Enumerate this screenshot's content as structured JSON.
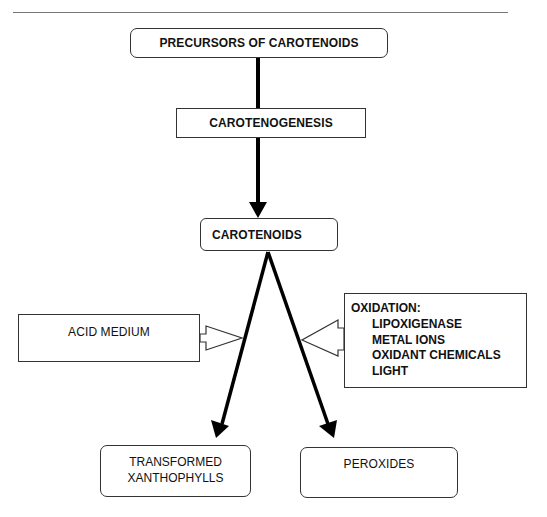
{
  "diagram": {
    "nodes": {
      "precursors": "PRECURSORS OF CAROTENOIDS",
      "carotenogenesis": "CAROTENOGENESIS",
      "carotenoids": "CAROTENOIDS",
      "acid_medium": "ACID MEDIUM",
      "oxidation": {
        "heading": "OXIDATION:",
        "items": [
          "LIPOXIGENASE",
          "METAL IONS",
          "OXIDANT CHEMICALS",
          "LIGHT"
        ]
      },
      "transformed_xanthophylls": {
        "line1": "TRANSFORMED",
        "line2": "XANTHOPHYLLS"
      },
      "peroxides": "PEROXIDES"
    },
    "edges": [
      {
        "from": "precursors",
        "to": "carotenogenesis",
        "style": "line"
      },
      {
        "from": "carotenogenesis",
        "to": "carotenoids",
        "style": "arrow"
      },
      {
        "from": "carotenoids",
        "to": "transformed_xanthophylls",
        "style": "arrow",
        "influenced_by": "acid_medium"
      },
      {
        "from": "carotenoids",
        "to": "peroxides",
        "style": "arrow",
        "influenced_by": "oxidation"
      }
    ],
    "colors": {
      "stroke": "#000000",
      "box_border": "#333333",
      "rule": "#777777",
      "background": "#ffffff"
    }
  }
}
